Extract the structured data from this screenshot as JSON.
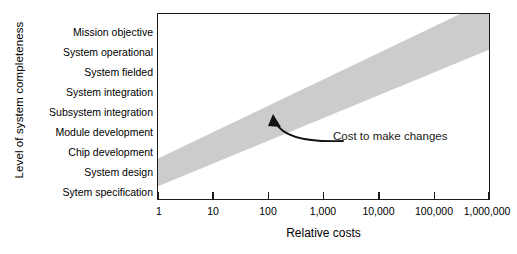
{
  "chart_data": {
    "type": "area",
    "title": "",
    "xlabel": "Relative costs",
    "ylabel": "Level of system completeness",
    "grid": false,
    "legend": "none",
    "x_scale": "log",
    "x_tick_labels": [
      "1",
      "10",
      "100",
      "1,000",
      "10,000",
      "100,000",
      "1,000,000"
    ],
    "x_tick_values": [
      1,
      10,
      100,
      1000,
      10000,
      100000,
      1000000
    ],
    "xlim": [
      1,
      1000000
    ],
    "y_tick_labels": [
      "Mission objective",
      "System operational",
      "System fielded",
      "System integration",
      "Subsystem integration",
      "Module development",
      "Chip development",
      "System design",
      "Sytem specification"
    ],
    "ylim": [
      0,
      8
    ],
    "band": {
      "name": "Cost to make changes",
      "color": "#cccccc",
      "lower_bound": {
        "x": [
          1,
          1000000
        ],
        "y": [
          0.55,
          6.45
        ]
      },
      "upper_bound": {
        "x": [
          1,
          1000000
        ],
        "y": [
          1.75,
          8.6
        ]
      }
    },
    "annotations": [
      {
        "text": "Cost to make changes",
        "arrow": true,
        "points_to": {
          "x": 130,
          "y": 3.6
        }
      }
    ]
  },
  "chart": {
    "y_axis_title": "Level of system completeness",
    "x_axis_title": "Relative costs",
    "y_categories": [
      "Mission objective",
      "System operational",
      "System fielded",
      "System integration",
      "Subsystem integration",
      "Module development",
      "Chip development",
      "System design",
      "Sytem specification"
    ],
    "x_ticks": [
      "1",
      "10",
      "100",
      "1,000",
      "10,000",
      "100,000",
      "1,000,000"
    ],
    "annotation_label": "Cost to make changes",
    "band_color": "#cccccc",
    "axis_color": "#1a1a1a"
  }
}
